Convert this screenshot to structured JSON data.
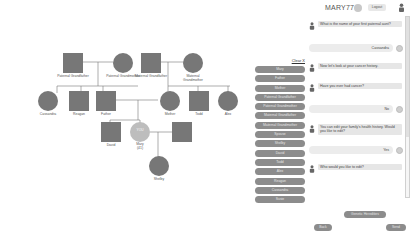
{
  "header": {
    "username": "MARY77",
    "logout_label": "Logout"
  },
  "tree": {
    "nodes": [
      {
        "id": "pgf",
        "label": "Paternal Grandfather",
        "sex": "male"
      },
      {
        "id": "pgm",
        "label": "Paternal Grandmother",
        "sex": "female"
      },
      {
        "id": "mgf",
        "label": "Maternal Grandfather",
        "sex": "male"
      },
      {
        "id": "mgm",
        "label": "Maternal Grandmother",
        "sex": "female"
      },
      {
        "id": "cassandra",
        "label": "Cassandra",
        "sex": "female"
      },
      {
        "id": "reagan",
        "label": "Reagan",
        "sex": "male"
      },
      {
        "id": "father",
        "label": "Father",
        "sex": "male"
      },
      {
        "id": "mother",
        "label": "Mother",
        "sex": "female"
      },
      {
        "id": "todd",
        "label": "Todd",
        "sex": "male"
      },
      {
        "id": "alex",
        "label": "Alex",
        "sex": "female"
      },
      {
        "id": "david",
        "label": "David",
        "sex": "male"
      },
      {
        "id": "mary",
        "label": "Mary",
        "sex": "female",
        "inner": "YOU",
        "age": "(41)"
      },
      {
        "id": "spouse",
        "label": "",
        "sex": "male"
      },
      {
        "id": "shelby",
        "label": "Shelby",
        "sex": "female"
      }
    ]
  },
  "relatives": {
    "clear_label": "Clear X",
    "items": [
      "Mary",
      "Father",
      "Mother",
      "Paternal Grandfather",
      "Paternal Grandmother",
      "Maternal Grandfather",
      "Maternal Grandmother",
      "Spouse",
      "Shelby",
      "David",
      "Todd",
      "Alex",
      "Reagan",
      "Cassandra",
      "Susie"
    ]
  },
  "chat": {
    "messages": [
      {
        "type": "question",
        "text": "What is the name of your first paternal aunt?"
      },
      {
        "type": "answer",
        "text": "Cassandra"
      },
      {
        "type": "question",
        "text": "Now let's look at your cancer history."
      },
      {
        "type": "question",
        "text": "Have you ever had cancer?"
      },
      {
        "type": "answer",
        "text": "No"
      },
      {
        "type": "question",
        "text": "You can edit your family's health history. Would you like to edit?"
      },
      {
        "type": "answer",
        "text": "Yes"
      },
      {
        "type": "question",
        "text": "Who would you like to edit?"
      }
    ]
  },
  "footer": {
    "genetic_label": "Genetic Heredities",
    "back_label": "Back",
    "send_label": "Send"
  },
  "colors": {
    "node": "#777777",
    "self_node": "#bdbdbd",
    "pill": "#8c8c8c",
    "bubble": "#e6e6e6"
  }
}
